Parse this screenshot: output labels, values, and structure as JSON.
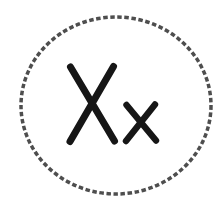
{
  "icon": {
    "letters": "Xx",
    "capital_letter": "X",
    "small_letter": "x",
    "border_style": "dashed-circle",
    "colors": {
      "background": "#ffffff",
      "letters": "#161616",
      "border": "#3f3f3f"
    }
  }
}
